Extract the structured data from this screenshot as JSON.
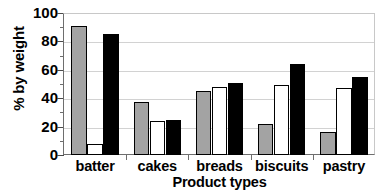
{
  "chart_data": {
    "type": "bar",
    "title": "",
    "subtitle": "",
    "xlabel": "Product types",
    "ylabel": "% by weight",
    "categories": [
      "batter",
      "cakes",
      "breads",
      "biscuits",
      "pastry"
    ],
    "series": [
      {
        "name": "series-1",
        "color": "#a3a3a3",
        "values": [
          91,
          37,
          45,
          22,
          16
        ]
      },
      {
        "name": "series-2",
        "color": "#ffffff",
        "values": [
          8,
          24,
          48,
          49,
          47
        ]
      },
      {
        "name": "series-3",
        "color": "#000000",
        "values": [
          85,
          25,
          51,
          64,
          55
        ]
      }
    ],
    "ylim": [
      0,
      100
    ],
    "y_major_ticks": [
      0,
      20,
      40,
      60,
      80,
      100
    ],
    "y_minor_ticks": [
      10,
      30,
      50,
      70,
      90
    ],
    "y_tick_labels": [
      "0",
      "20",
      "40",
      "60",
      "80",
      "100"
    ],
    "grid": true,
    "grid_axis": "y",
    "legend": false,
    "legend_position": "none",
    "bar_outline_color": "#000000",
    "plot_border_color": "#c8c8c8",
    "axis_color": "#6e6e6e",
    "gridline_color": "#d2d2d2",
    "background": "#ffffff"
  }
}
